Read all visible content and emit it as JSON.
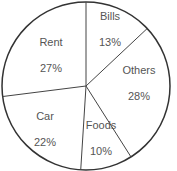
{
  "chart_data": {
    "type": "pie",
    "title": "",
    "categories": [
      "Bills",
      "Others",
      "Foods",
      "Car",
      "Rent"
    ],
    "values": [
      13,
      28,
      10,
      22,
      27
    ],
    "labels": [
      "13%",
      "28%",
      "10%",
      "22%",
      "27%"
    ],
    "start_angle_deg": 0,
    "direction": "clockwise",
    "legend": "none"
  },
  "slices": [
    {
      "name": "Bills",
      "pct": "13%"
    },
    {
      "name": "Others",
      "pct": "28%"
    },
    {
      "name": "Foods",
      "pct": "10%"
    },
    {
      "name": "Car",
      "pct": "22%"
    },
    {
      "name": "Rent",
      "pct": "27%"
    }
  ]
}
